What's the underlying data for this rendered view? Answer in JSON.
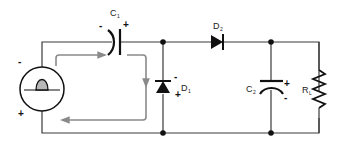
{
  "diagram": {
    "colors": {
      "wire": "#3a3a3a",
      "component": "#111111",
      "current_flow": "#8a8a8a",
      "source_pulse_fill": "#b8b8b8"
    },
    "source": {
      "icon": "ac-source-half-wave-icon",
      "top_polarity": "-",
      "bottom_polarity": "+"
    },
    "components": {
      "c1": {
        "label": "C",
        "subscript": "1",
        "left_polarity": "-",
        "right_polarity": "+"
      },
      "d1": {
        "label": "D",
        "subscript": "1",
        "top_polarity": "-",
        "bottom_polarity": "+"
      },
      "d2": {
        "label": "D",
        "subscript": "2"
      },
      "c2": {
        "label": "C",
        "subscript": "2",
        "top_polarity": "+",
        "bottom_polarity": "-"
      },
      "rl": {
        "label": "R",
        "subscript": "L"
      }
    },
    "current_path": {
      "description": "Charging loop: source -> C1 -> down through D1 -> back to source"
    }
  }
}
